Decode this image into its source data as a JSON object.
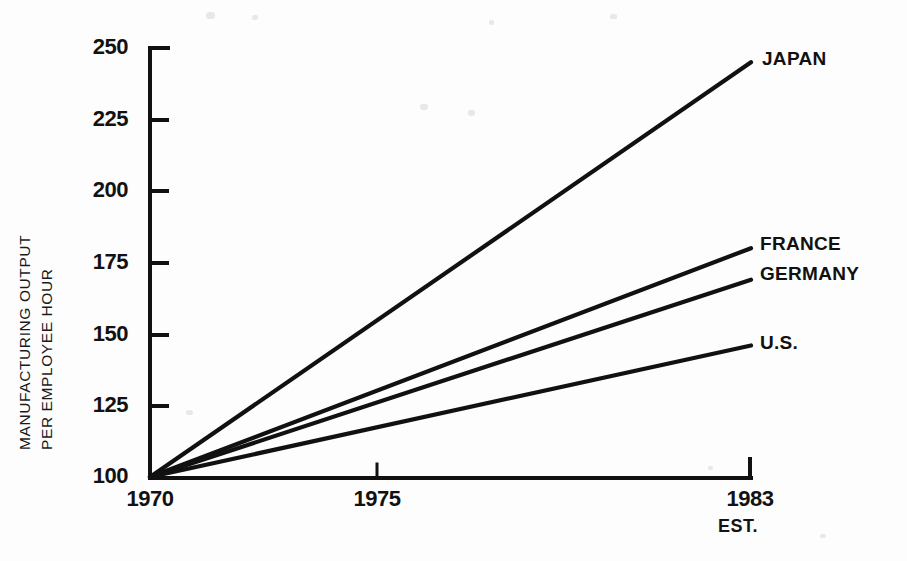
{
  "chart_data": {
    "type": "line",
    "title": "",
    "subtitle": "",
    "xlabel": "",
    "ylabel": "MANUFACTURING OUTPUT PER EMPLOYEE HOUR",
    "ylabel_lines": [
      "MANUFACTURING OUTPUT",
      "PER EMPLOYEE HOUR"
    ],
    "x": [
      1970,
      1983
    ],
    "xlim": [
      1970,
      1983
    ],
    "ylim": [
      100,
      250
    ],
    "xticks": [
      1970,
      1975,
      1983
    ],
    "xtick_labels": [
      "1970",
      "1975",
      "1983"
    ],
    "yticks": [
      100,
      125,
      150,
      175,
      200,
      225,
      250
    ],
    "ytick_labels": [
      "100",
      "125",
      "150",
      "175",
      "200",
      "225",
      "250"
    ],
    "grid": false,
    "legend_position": "right-inline-end-of-line",
    "x_axis_note": "EST.",
    "x_axis_note_at": 1983,
    "series": [
      {
        "name": "JAPAN",
        "values": [
          100,
          245
        ],
        "label": "JAPAN",
        "color": "#111111"
      },
      {
        "name": "FRANCE",
        "values": [
          100,
          180
        ],
        "label": "FRANCE",
        "color": "#111111"
      },
      {
        "name": "GERMANY",
        "values": [
          100,
          169
        ],
        "label": "GERMANY",
        "color": "#111111"
      },
      {
        "name": "U.S.",
        "values": [
          100,
          146
        ],
        "label": "U.S.",
        "color": "#111111"
      }
    ]
  },
  "axes": {
    "y_tick_250": "250",
    "y_tick_225": "225",
    "y_tick_200": "200",
    "y_tick_175": "175",
    "y_tick_150": "150",
    "y_tick_125": "125",
    "y_tick_100": "100",
    "x_tick_1970": "1970",
    "x_tick_1975": "1975",
    "x_tick_1983": "1983",
    "x_note_est": "EST."
  },
  "labels": {
    "ylabel_top": "MANUFACTURING OUTPUT",
    "ylabel_bottom": "PER EMPLOYEE HOUR",
    "series_japan": "JAPAN",
    "series_france": "FRANCE",
    "series_germany": "GERMANY",
    "series_us": "U.S."
  },
  "colors": {
    "ink": "#111111",
    "paper": "#fdfdfd"
  }
}
